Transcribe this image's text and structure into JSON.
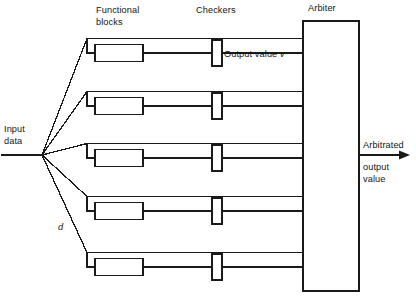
{
  "figure": {
    "type": "block-diagram",
    "title_visible": false,
    "background_color": "#ffffff",
    "stroke_color": "#1a1a1a"
  },
  "labels": {
    "functional_blocks": "Functional\nblocks",
    "checkers": "Checkers",
    "arbiter": "Arbiter",
    "input_data": "Input\ndata",
    "output_value_prefix": "Output value ",
    "output_value_symbol": "v",
    "distance_symbol": "d",
    "arbitrated_line1": "Arbitrated",
    "arbitrated_line2": "output",
    "arbitrated_line3": "value"
  },
  "structure": {
    "channel_count": 5,
    "channels": [
      {
        "id": 1,
        "name": "channel-1",
        "row_y": 53,
        "entry_style": "elbow-up"
      },
      {
        "id": 2,
        "name": "channel-2",
        "row_y": 106,
        "entry_style": "elbow-up"
      },
      {
        "id": 3,
        "name": "channel-3",
        "row_y": 158,
        "entry_style": "elbow-straight"
      },
      {
        "id": 4,
        "name": "channel-4",
        "row_y": 211,
        "entry_style": "elbow-down"
      },
      {
        "id": 5,
        "name": "channel-5",
        "row_y": 267,
        "entry_style": "elbow-down"
      }
    ],
    "fan_point": {
      "x": 42,
      "y": 155
    },
    "input_line": {
      "x1": 2,
      "y1": 155,
      "x2": 42,
      "y2": 155
    },
    "functional_block": {
      "x": 95,
      "width": 48,
      "height": 17
    },
    "checker": {
      "x": 212,
      "width": 10,
      "height": 26
    },
    "arbiter_box": {
      "x": 303,
      "y": 21,
      "width": 56,
      "height": 270
    },
    "output_arrow": {
      "x1": 359,
      "y1": 155,
      "x2": 410,
      "y2": 155
    }
  },
  "label_positions": {
    "functional_blocks": {
      "x": 96,
      "y": 5
    },
    "checkers": {
      "x": 196,
      "y": 5
    },
    "arbiter": {
      "x": 308,
      "y": 3
    },
    "input_data": {
      "x": 4,
      "y": 124
    },
    "output_value": {
      "x": 224,
      "y": 49
    },
    "distance_symbol": {
      "x": 58,
      "y": 222
    },
    "arbitrated": {
      "x": 363,
      "y": 140
    },
    "output_value_text": {
      "x": 363,
      "y": 162
    }
  }
}
